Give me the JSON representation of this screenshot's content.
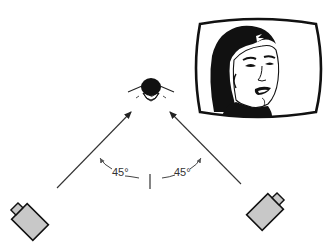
{
  "diagram": {
    "subject": {
      "label": "subject-head-top-view",
      "x": 151,
      "y": 88
    },
    "center_line": {
      "x": 150,
      "y1": 174,
      "y2": 189
    },
    "angles": [
      {
        "label": "45°",
        "side": "left"
      },
      {
        "label": "45°",
        "side": "right"
      }
    ],
    "cameras": [
      {
        "side": "left",
        "x": 28,
        "y": 222,
        "angle": -45
      },
      {
        "side": "right",
        "x": 263,
        "y": 212,
        "angle": 45
      }
    ],
    "monitor": {
      "content": "close-up of a man's face on TV screen"
    },
    "colors": {
      "line": "#333333",
      "camera_fill": "#c8c8c8",
      "ink": "#111111",
      "background": "#ffffff"
    }
  }
}
